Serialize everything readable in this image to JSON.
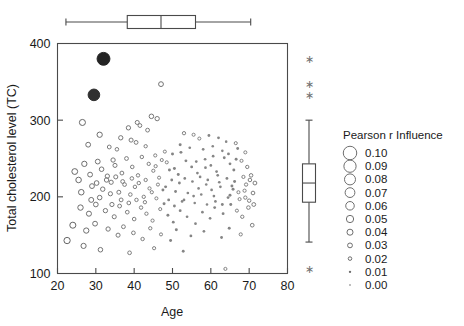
{
  "chart_data": {
    "type": "scatter",
    "title": "",
    "xlabel": "Age",
    "ylabel": "Total cholesterol level (TC)",
    "xlim": [
      20,
      80
    ],
    "ylim": [
      100,
      400
    ],
    "xticks": [
      20,
      30,
      40,
      50,
      60,
      70,
      80
    ],
    "yticks": [
      100,
      200,
      300,
      400
    ],
    "grid": false,
    "size_encoding": "Pearson r Influence",
    "legend_position": "right",
    "marginal_boxplots": {
      "top": {
        "variable": "Age",
        "min_whisker": 22.2,
        "q1": 38.2,
        "median": 47.0,
        "q3": 56.0,
        "max_whisker": 70.4,
        "outliers": []
      },
      "right": {
        "variable": "Total cholesterol level (TC)",
        "min_whisker": 141.0,
        "q1": 193.0,
        "median": 218.0,
        "q3": 243.0,
        "max_whisker": 300.0,
        "outliers": [
          380.0,
          347.0,
          333.0,
          106.0
        ]
      }
    },
    "points": [
      {
        "x": 32.0,
        "y": 380.0,
        "r": 0.095
      },
      {
        "x": 29.5,
        "y": 333.0,
        "r": 0.085
      },
      {
        "x": 47.0,
        "y": 347.0,
        "r": 0.03
      },
      {
        "x": 44.5,
        "y": 305.0,
        "r": 0.028
      },
      {
        "x": 46.0,
        "y": 302.0,
        "r": 0.026
      },
      {
        "x": 40.8,
        "y": 297.0,
        "r": 0.024
      },
      {
        "x": 41.5,
        "y": 293.0,
        "r": 0.022
      },
      {
        "x": 26.5,
        "y": 297.0,
        "r": 0.04
      },
      {
        "x": 43.5,
        "y": 287.0,
        "r": 0.022
      },
      {
        "x": 38.5,
        "y": 290.0,
        "r": 0.026
      },
      {
        "x": 31.0,
        "y": 281.0,
        "r": 0.034
      },
      {
        "x": 36.5,
        "y": 277.0,
        "r": 0.026
      },
      {
        "x": 39.2,
        "y": 274.0,
        "r": 0.024
      },
      {
        "x": 40.5,
        "y": 271.0,
        "r": 0.022
      },
      {
        "x": 28.0,
        "y": 268.0,
        "r": 0.03
      },
      {
        "x": 33.5,
        "y": 265.0,
        "r": 0.022
      },
      {
        "x": 35.5,
        "y": 262.0,
        "r": 0.02
      },
      {
        "x": 43.0,
        "y": 266.0,
        "r": 0.018
      },
      {
        "x": 53.0,
        "y": 283.0,
        "r": 0.018
      },
      {
        "x": 55.5,
        "y": 281.0,
        "r": 0.016
      },
      {
        "x": 57.0,
        "y": 276.0,
        "r": 0.016
      },
      {
        "x": 59.5,
        "y": 280.0,
        "r": 0.014
      },
      {
        "x": 62.0,
        "y": 277.0,
        "r": 0.014
      },
      {
        "x": 64.0,
        "y": 272.0,
        "r": 0.012
      },
      {
        "x": 66.5,
        "y": 270.0,
        "r": 0.016
      },
      {
        "x": 52.0,
        "y": 268.0,
        "r": 0.015
      },
      {
        "x": 54.5,
        "y": 264.0,
        "r": 0.013
      },
      {
        "x": 58.0,
        "y": 262.0,
        "r": 0.013
      },
      {
        "x": 60.5,
        "y": 266.0,
        "r": 0.012
      },
      {
        "x": 63.0,
        "y": 260.0,
        "r": 0.012
      },
      {
        "x": 67.0,
        "y": 263.0,
        "r": 0.014
      },
      {
        "x": 69.0,
        "y": 258.0,
        "r": 0.016
      },
      {
        "x": 48.0,
        "y": 259.0,
        "r": 0.016
      },
      {
        "x": 50.0,
        "y": 256.0,
        "r": 0.015
      },
      {
        "x": 45.5,
        "y": 254.0,
        "r": 0.017
      },
      {
        "x": 42.0,
        "y": 252.0,
        "r": 0.019
      },
      {
        "x": 38.0,
        "y": 250.0,
        "r": 0.022
      },
      {
        "x": 34.5,
        "y": 248.0,
        "r": 0.026
      },
      {
        "x": 30.5,
        "y": 246.0,
        "r": 0.03
      },
      {
        "x": 27.0,
        "y": 243.0,
        "r": 0.034
      },
      {
        "x": 24.5,
        "y": 233.0,
        "r": 0.038
      },
      {
        "x": 25.5,
        "y": 222.0,
        "r": 0.036
      },
      {
        "x": 28.5,
        "y": 229.0,
        "r": 0.03
      },
      {
        "x": 31.5,
        "y": 236.0,
        "r": 0.028
      },
      {
        "x": 33.0,
        "y": 227.0,
        "r": 0.026
      },
      {
        "x": 35.0,
        "y": 241.0,
        "r": 0.024
      },
      {
        "x": 36.8,
        "y": 231.0,
        "r": 0.022
      },
      {
        "x": 39.5,
        "y": 239.0,
        "r": 0.02
      },
      {
        "x": 41.0,
        "y": 228.0,
        "r": 0.019
      },
      {
        "x": 43.8,
        "y": 243.0,
        "r": 0.018
      },
      {
        "x": 45.0,
        "y": 234.0,
        "r": 0.017
      },
      {
        "x": 46.5,
        "y": 225.0,
        "r": 0.016
      },
      {
        "x": 48.5,
        "y": 245.0,
        "r": 0.016
      },
      {
        "x": 50.5,
        "y": 237.0,
        "r": 0.015
      },
      {
        "x": 51.5,
        "y": 229.0,
        "r": 0.015
      },
      {
        "x": 53.5,
        "y": 247.0,
        "r": 0.014
      },
      {
        "x": 55.0,
        "y": 239.0,
        "r": 0.014
      },
      {
        "x": 56.5,
        "y": 231.0,
        "r": 0.013
      },
      {
        "x": 58.5,
        "y": 249.0,
        "r": 0.013
      },
      {
        "x": 60.0,
        "y": 241.0,
        "r": 0.013
      },
      {
        "x": 61.5,
        "y": 233.0,
        "r": 0.013
      },
      {
        "x": 63.5,
        "y": 251.0,
        "r": 0.014
      },
      {
        "x": 65.0,
        "y": 243.0,
        "r": 0.014
      },
      {
        "x": 66.0,
        "y": 235.0,
        "r": 0.015
      },
      {
        "x": 68.0,
        "y": 247.0,
        "r": 0.016
      },
      {
        "x": 69.5,
        "y": 239.0,
        "r": 0.018
      },
      {
        "x": 70.5,
        "y": 228.0,
        "r": 0.02
      },
      {
        "x": 71.5,
        "y": 218.0,
        "r": 0.022
      },
      {
        "x": 29.0,
        "y": 214.0,
        "r": 0.03
      },
      {
        "x": 31.8,
        "y": 210.0,
        "r": 0.027
      },
      {
        "x": 34.0,
        "y": 219.0,
        "r": 0.025
      },
      {
        "x": 36.0,
        "y": 206.0,
        "r": 0.023
      },
      {
        "x": 37.5,
        "y": 216.0,
        "r": 0.021
      },
      {
        "x": 39.0,
        "y": 203.0,
        "r": 0.02
      },
      {
        "x": 40.2,
        "y": 213.0,
        "r": 0.019
      },
      {
        "x": 42.5,
        "y": 200.0,
        "r": 0.018
      },
      {
        "x": 44.0,
        "y": 211.0,
        "r": 0.017
      },
      {
        "x": 45.8,
        "y": 198.0,
        "r": 0.016
      },
      {
        "x": 47.5,
        "y": 209.0,
        "r": 0.015
      },
      {
        "x": 49.0,
        "y": 196.0,
        "r": 0.014
      },
      {
        "x": 50.8,
        "y": 207.0,
        "r": 0.014
      },
      {
        "x": 52.5,
        "y": 194.0,
        "r": 0.013
      },
      {
        "x": 54.0,
        "y": 205.0,
        "r": 0.013
      },
      {
        "x": 55.8,
        "y": 192.0,
        "r": 0.012
      },
      {
        "x": 57.5,
        "y": 203.0,
        "r": 0.012
      },
      {
        "x": 59.0,
        "y": 190.0,
        "r": 0.012
      },
      {
        "x": 60.8,
        "y": 201.0,
        "r": 0.013
      },
      {
        "x": 62.5,
        "y": 213.0,
        "r": 0.013
      },
      {
        "x": 64.5,
        "y": 199.0,
        "r": 0.014
      },
      {
        "x": 65.8,
        "y": 210.0,
        "r": 0.015
      },
      {
        "x": 67.5,
        "y": 197.0,
        "r": 0.016
      },
      {
        "x": 68.8,
        "y": 208.0,
        "r": 0.017
      },
      {
        "x": 70.0,
        "y": 195.0,
        "r": 0.019
      },
      {
        "x": 71.0,
        "y": 205.0,
        "r": 0.021
      },
      {
        "x": 26.0,
        "y": 186.0,
        "r": 0.035
      },
      {
        "x": 28.2,
        "y": 178.0,
        "r": 0.032
      },
      {
        "x": 30.0,
        "y": 190.0,
        "r": 0.029
      },
      {
        "x": 32.5,
        "y": 182.0,
        "r": 0.026
      },
      {
        "x": 34.8,
        "y": 174.0,
        "r": 0.024
      },
      {
        "x": 36.2,
        "y": 188.0,
        "r": 0.022
      },
      {
        "x": 38.2,
        "y": 180.0,
        "r": 0.021
      },
      {
        "x": 40.0,
        "y": 171.0,
        "r": 0.02
      },
      {
        "x": 41.8,
        "y": 186.0,
        "r": 0.019
      },
      {
        "x": 43.2,
        "y": 178.0,
        "r": 0.018
      },
      {
        "x": 44.8,
        "y": 169.0,
        "r": 0.017
      },
      {
        "x": 46.8,
        "y": 184.0,
        "r": 0.016
      },
      {
        "x": 48.8,
        "y": 176.0,
        "r": 0.015
      },
      {
        "x": 50.2,
        "y": 167.0,
        "r": 0.014
      },
      {
        "x": 52.0,
        "y": 182.0,
        "r": 0.014
      },
      {
        "x": 53.8,
        "y": 174.0,
        "r": 0.013
      },
      {
        "x": 56.0,
        "y": 165.0,
        "r": 0.013
      },
      {
        "x": 57.8,
        "y": 180.0,
        "r": 0.013
      },
      {
        "x": 59.8,
        "y": 172.0,
        "r": 0.013
      },
      {
        "x": 61.0,
        "y": 186.0,
        "r": 0.014
      },
      {
        "x": 63.2,
        "y": 178.0,
        "r": 0.014
      },
      {
        "x": 65.2,
        "y": 190.0,
        "r": 0.015
      },
      {
        "x": 66.8,
        "y": 182.0,
        "r": 0.016
      },
      {
        "x": 68.2,
        "y": 174.0,
        "r": 0.018
      },
      {
        "x": 69.8,
        "y": 186.0,
        "r": 0.02
      },
      {
        "x": 24.0,
        "y": 163.0,
        "r": 0.04
      },
      {
        "x": 27.5,
        "y": 156.0,
        "r": 0.034
      },
      {
        "x": 29.8,
        "y": 165.0,
        "r": 0.03
      },
      {
        "x": 33.2,
        "y": 158.0,
        "r": 0.026
      },
      {
        "x": 35.8,
        "y": 150.0,
        "r": 0.024
      },
      {
        "x": 37.2,
        "y": 161.0,
        "r": 0.022
      },
      {
        "x": 39.8,
        "y": 153.0,
        "r": 0.021
      },
      {
        "x": 42.2,
        "y": 145.0,
        "r": 0.019
      },
      {
        "x": 44.2,
        "y": 159.0,
        "r": 0.018
      },
      {
        "x": 47.0,
        "y": 151.0,
        "r": 0.016
      },
      {
        "x": 49.5,
        "y": 143.0,
        "r": 0.015
      },
      {
        "x": 51.0,
        "y": 157.0,
        "r": 0.015
      },
      {
        "x": 54.8,
        "y": 149.0,
        "r": 0.014
      },
      {
        "x": 58.2,
        "y": 155.0,
        "r": 0.013
      },
      {
        "x": 62.8,
        "y": 147.0,
        "r": 0.014
      },
      {
        "x": 64.8,
        "y": 159.0,
        "r": 0.015
      },
      {
        "x": 67.8,
        "y": 151.0,
        "r": 0.017
      },
      {
        "x": 70.8,
        "y": 163.0,
        "r": 0.021
      },
      {
        "x": 22.5,
        "y": 143.0,
        "r": 0.042
      },
      {
        "x": 26.8,
        "y": 136.0,
        "r": 0.033
      },
      {
        "x": 31.2,
        "y": 131.0,
        "r": 0.028
      },
      {
        "x": 38.8,
        "y": 127.0,
        "r": 0.021
      },
      {
        "x": 45.2,
        "y": 133.0,
        "r": 0.017
      },
      {
        "x": 52.8,
        "y": 129.0,
        "r": 0.014
      },
      {
        "x": 63.8,
        "y": 106.0,
        "r": 0.016
      },
      {
        "x": 49.8,
        "y": 222.0,
        "r": 0.014
      },
      {
        "x": 51.8,
        "y": 218.0,
        "r": 0.014
      },
      {
        "x": 53.2,
        "y": 224.0,
        "r": 0.013
      },
      {
        "x": 55.2,
        "y": 220.0,
        "r": 0.013
      },
      {
        "x": 57.2,
        "y": 226.0,
        "r": 0.013
      },
      {
        "x": 59.2,
        "y": 222.0,
        "r": 0.013
      },
      {
        "x": 61.8,
        "y": 228.0,
        "r": 0.013
      },
      {
        "x": 64.2,
        "y": 224.0,
        "r": 0.014
      },
      {
        "x": 66.2,
        "y": 220.0,
        "r": 0.015
      },
      {
        "x": 68.5,
        "y": 226.0,
        "r": 0.017
      },
      {
        "x": 70.2,
        "y": 222.0,
        "r": 0.02
      },
      {
        "x": 43.0,
        "y": 222.0,
        "r": 0.018
      },
      {
        "x": 41.2,
        "y": 218.0,
        "r": 0.019
      },
      {
        "x": 39.4,
        "y": 224.0,
        "r": 0.02
      },
      {
        "x": 37.0,
        "y": 220.0,
        "r": 0.022
      },
      {
        "x": 35.2,
        "y": 226.0,
        "r": 0.024
      },
      {
        "x": 32.8,
        "y": 222.0,
        "r": 0.027
      },
      {
        "x": 30.2,
        "y": 218.0,
        "r": 0.029
      },
      {
        "x": 46.2,
        "y": 216.0,
        "r": 0.016
      },
      {
        "x": 48.2,
        "y": 213.0,
        "r": 0.015
      },
      {
        "x": 44.6,
        "y": 206.0,
        "r": 0.017
      },
      {
        "x": 56.8,
        "y": 211.0,
        "r": 0.012
      },
      {
        "x": 58.8,
        "y": 216.0,
        "r": 0.012
      },
      {
        "x": 60.2,
        "y": 209.0,
        "r": 0.013
      },
      {
        "x": 62.2,
        "y": 219.0,
        "r": 0.013
      },
      {
        "x": 65.5,
        "y": 214.0,
        "r": 0.015
      },
      {
        "x": 67.2,
        "y": 206.0,
        "r": 0.016
      },
      {
        "x": 69.2,
        "y": 216.0,
        "r": 0.018
      },
      {
        "x": 53.0,
        "y": 196.0,
        "r": 0.013
      },
      {
        "x": 55.5,
        "y": 201.0,
        "r": 0.013
      },
      {
        "x": 47.8,
        "y": 191.0,
        "r": 0.015
      },
      {
        "x": 50.5,
        "y": 188.0,
        "r": 0.014
      },
      {
        "x": 42.8,
        "y": 193.0,
        "r": 0.018
      },
      {
        "x": 40.6,
        "y": 196.0,
        "r": 0.019
      },
      {
        "x": 45.6,
        "y": 240.0,
        "r": 0.017
      },
      {
        "x": 47.2,
        "y": 248.0,
        "r": 0.016
      },
      {
        "x": 49.2,
        "y": 235.0,
        "r": 0.015
      },
      {
        "x": 60.6,
        "y": 253.0,
        "r": 0.013
      },
      {
        "x": 64.6,
        "y": 256.0,
        "r": 0.014
      },
      {
        "x": 66.6,
        "y": 249.0,
        "r": 0.015
      },
      {
        "x": 33.8,
        "y": 204.0,
        "r": 0.025
      },
      {
        "x": 31.0,
        "y": 199.0,
        "r": 0.028
      },
      {
        "x": 28.8,
        "y": 196.0,
        "r": 0.031
      },
      {
        "x": 26.2,
        "y": 206.0,
        "r": 0.036
      },
      {
        "x": 36.6,
        "y": 196.0,
        "r": 0.022
      },
      {
        "x": 38.6,
        "y": 192.0,
        "r": 0.021
      },
      {
        "x": 34.2,
        "y": 190.0,
        "r": 0.025
      },
      {
        "x": 52.2,
        "y": 258.0,
        "r": 0.015
      },
      {
        "x": 56.2,
        "y": 246.0,
        "r": 0.013
      },
      {
        "x": 58.6,
        "y": 238.0,
        "r": 0.013
      },
      {
        "x": 69.0,
        "y": 199.0,
        "r": 0.018
      },
      {
        "x": 71.2,
        "y": 190.0,
        "r": 0.022
      },
      {
        "x": 61.2,
        "y": 194.0,
        "r": 0.013
      },
      {
        "x": 63.0,
        "y": 190.0,
        "r": 0.014
      },
      {
        "x": 65.0,
        "y": 202.0,
        "r": 0.015
      }
    ]
  },
  "legend": {
    "title": "Pearson r Influence",
    "entries": [
      {
        "label": "0.10",
        "value": 0.1
      },
      {
        "label": "0.09",
        "value": 0.09
      },
      {
        "label": "0.08",
        "value": 0.08
      },
      {
        "label": "0.07",
        "value": 0.07
      },
      {
        "label": "0.06",
        "value": 0.06
      },
      {
        "label": "0.05",
        "value": 0.05
      },
      {
        "label": "0.04",
        "value": 0.04
      },
      {
        "label": "0.03",
        "value": 0.03
      },
      {
        "label": "0.02",
        "value": 0.02
      },
      {
        "label": "0.01",
        "value": 0.01
      },
      {
        "label": "0.00",
        "value": 0.0
      }
    ]
  },
  "colors": {
    "axis": "#4a4a4a",
    "point": "#2b2b2b",
    "text": "#1a1a1a",
    "background": "#ffffff"
  }
}
